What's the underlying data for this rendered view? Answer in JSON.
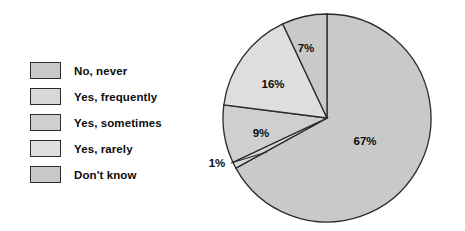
{
  "chart_data": {
    "type": "pie",
    "title": "",
    "categories": [
      "No, never",
      "Yes, frequently",
      "Yes, sometimes",
      "Yes, rarely",
      "Don't know"
    ],
    "values": [
      67,
      1,
      9,
      16,
      7
    ],
    "value_labels": [
      "67%",
      "1%",
      "9%",
      "16%",
      "7%"
    ],
    "unit": "%",
    "start_angle_deg": 0,
    "direction": "clockwise",
    "legend_position": "left",
    "grid": false,
    "colors": [
      "#c9c9c9",
      "#d8d8d8",
      "#cfcfcf",
      "#dedede",
      "#c9c9c9"
    ],
    "outline_color": "#2b2b2b"
  },
  "legend": {
    "items": [
      {
        "label": "No, never",
        "color": "#c9c9c9"
      },
      {
        "label": "Yes, frequently",
        "color": "#d8d8d8"
      },
      {
        "label": "Yes, sometimes",
        "color": "#cfcfcf"
      },
      {
        "label": "Yes, rarely",
        "color": "#dedede"
      },
      {
        "label": "Don't know",
        "color": "#c9c9c9"
      }
    ]
  },
  "pie_labels": {
    "slice_0": "67%",
    "slice_1": "1%",
    "slice_2": "9%",
    "slice_3": "16%",
    "slice_4": "7%"
  }
}
